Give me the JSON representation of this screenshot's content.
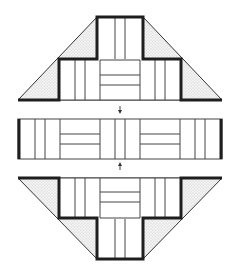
{
  "diagram": {
    "title": "",
    "colors": {
      "stroke": "#2a2a2a",
      "thick_stroke": "#1e1e1e",
      "stipple": "#d9d9d9",
      "background": "#ffffff"
    },
    "sections": [
      {
        "name": "upper-section",
        "panels": 9
      },
      {
        "name": "middle-band",
        "panels": 13
      },
      {
        "name": "lower-section",
        "panels": 9
      }
    ],
    "arrows": [
      {
        "name": "down-arrow",
        "direction": "down"
      },
      {
        "name": "up-arrow",
        "direction": "up"
      }
    ]
  }
}
